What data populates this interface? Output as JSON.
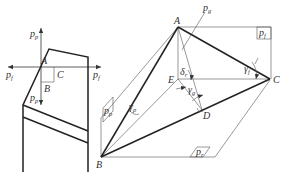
{
  "diagram": {
    "left_figure": {
      "labels": {
        "pp_top": "p",
        "pp_top_sub": "p",
        "pp_bottom": "p",
        "pp_bottom_sub": "p",
        "pf_left": "p",
        "pf_left_sub": "f",
        "pf_right": "p",
        "pf_right_sub": "f",
        "A": "A",
        "B": "B",
        "C": "C"
      }
    },
    "right_figure": {
      "labels": {
        "A": "A",
        "B": "B",
        "C": "C",
        "D": "D",
        "E": "E",
        "pg": "p",
        "pg_sub": "g",
        "pf_box": "p",
        "pf_box_sub": "f",
        "pp_box": "p",
        "pp_box_sub": "p",
        "pr_box": "p",
        "pr_box_sub": "r",
        "gamma_f": "γ",
        "gamma_f_sub": "f",
        "gamma_p": "γ",
        "gamma_p_sub": "p",
        "gamma_g": "γ",
        "gamma_g_sub": "g",
        "delta_r": "δ",
        "delta_r_sub": "r"
      }
    },
    "colors": {
      "line": "#222222",
      "thin_line": "#555555",
      "text": "#333333",
      "background": "#ffffff"
    }
  }
}
